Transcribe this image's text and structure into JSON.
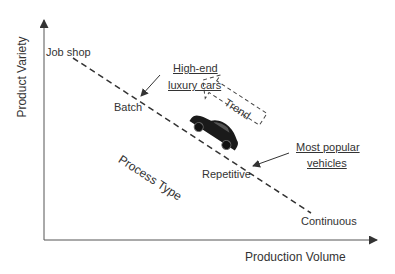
{
  "axes": {
    "x_label": "Production Volume",
    "y_label": "Product Variety"
  },
  "process_line": {
    "label": "Process Type",
    "points": [
      "Job shop",
      "Batch",
      "Repetitive",
      "Continuous"
    ]
  },
  "annotations": {
    "high_end": [
      "High-end",
      "luxury cars"
    ],
    "popular": [
      "Most popular",
      "vehicles"
    ],
    "trend": "Trend"
  },
  "icons": {
    "car": "car-icon"
  },
  "colors": {
    "ink": "#333333",
    "car": "#1a1a1a",
    "background": "#ffffff"
  }
}
